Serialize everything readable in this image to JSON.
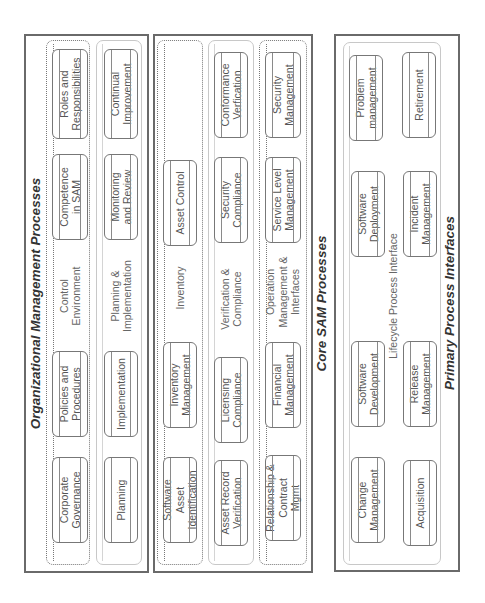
{
  "sections": {
    "organizational": {
      "title": "Organizational Management Processes",
      "control_environment": {
        "label": "Control Environment",
        "items": [
          "Corporate Governance",
          "Policies and Procedures",
          "Competence in SAM",
          "Roles and Responsibilities"
        ]
      },
      "planning_implementation": {
        "label": "Planning & Implementation",
        "items": [
          "Planning",
          "Implementation",
          "Monitoring and Review",
          "Continual Improvement"
        ]
      }
    },
    "core_sam": {
      "title": "Core SAM Processes",
      "inventory": {
        "label": "Inventory",
        "items": [
          "Software Asset Identification",
          "Inventory Management",
          "Asset Control"
        ]
      },
      "verification_compliance": {
        "label": "Verification & Compliance",
        "items": [
          "Asset Record Verification",
          "Licensing Compliance",
          "Security Compliance",
          "Conformance Verfication"
        ]
      },
      "operation_management": {
        "label": "Operation Management & Interfaces",
        "items": [
          "Relationship & Contract Mgmt",
          "Financial Management",
          "Service Level Management",
          "Security Management"
        ]
      }
    },
    "primary": {
      "title": "Primary Process Interfaces",
      "lifecycle": {
        "label": "Lifecycle Process Interface",
        "row1": [
          "Change Management",
          "Software Development",
          "Software Deployment",
          "Problem management"
        ],
        "row2": [
          "Acquisition",
          "Release Management",
          "Incident Management",
          "Retirement"
        ]
      }
    }
  }
}
